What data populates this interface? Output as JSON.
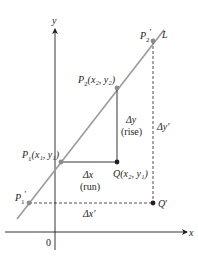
{
  "figure": {
    "axes": {
      "x_label": "x",
      "y_label": "y",
      "origin_label": "0"
    },
    "line": {
      "label": "L",
      "color": "#9a9a9a"
    },
    "points": {
      "P2_prime": {
        "label_main": "P",
        "label_sub": "2",
        "label_prime": "′"
      },
      "P2": {
        "label_main": "P",
        "label_sub": "2",
        "label_coords": "(x₂, y₂)"
      },
      "P1": {
        "label_main": "P",
        "label_sub": "1",
        "label_coords": "(x₁, y₁)"
      },
      "P1_prime": {
        "label_main": "P",
        "label_sub": "1",
        "label_prime": "′"
      },
      "Q": {
        "label_main": "Q",
        "label_coords": "(x₂, y₁)"
      },
      "Q_prime": {
        "label_main": "Q",
        "label_prime": "′"
      }
    },
    "annotations": {
      "delta_y": "Δy",
      "rise": "(rise)",
      "delta_x": "Δx",
      "run": "(run)",
      "delta_y_prime": "Δy′",
      "delta_x_prime": "Δx′"
    },
    "colors": {
      "ink": "#231f20",
      "line_gray": "#9a9a9a",
      "point_gray": "#8c8c8c",
      "point_black": "#231f20"
    }
  }
}
